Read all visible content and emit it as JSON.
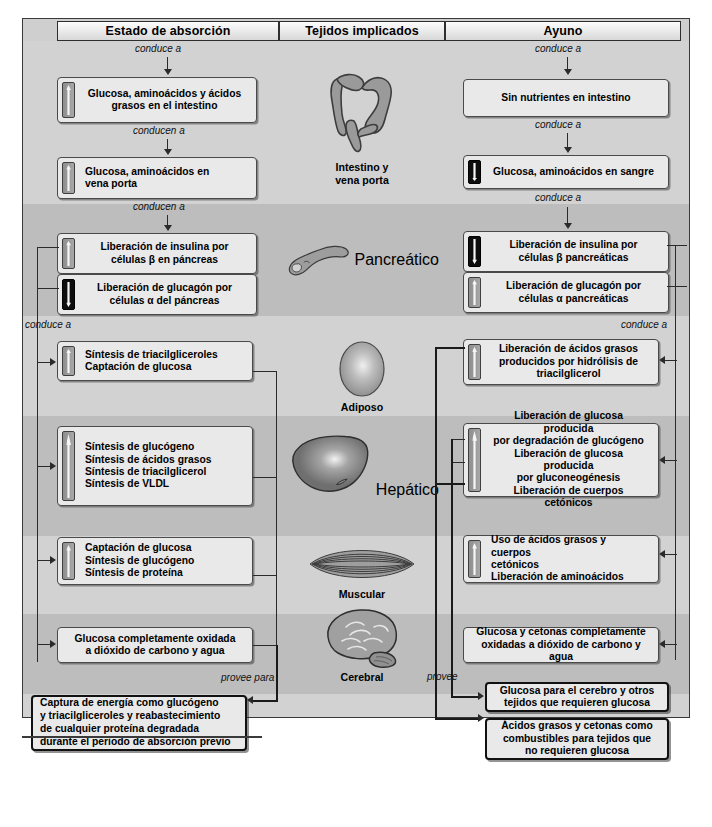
{
  "headers": {
    "left": "Estado de absorción",
    "center": "Tejidos implicados",
    "right": "Ayuno"
  },
  "connector_labels": {
    "l1": "conduce a",
    "l2": "conducen a",
    "l3": "conducen a",
    "l4": "conduce a",
    "r1": "conduce a",
    "r2": "conduce a",
    "r3": "conduce a",
    "r4": "conduce a",
    "provee_para": "provee para",
    "provee": "provee"
  },
  "tissues": [
    {
      "name": "intestine",
      "icon": "intestine-icon",
      "caption": "Intestino y\nvena porta",
      "caption_line1": "Intestino y",
      "caption_line2": "vena porta"
    },
    {
      "name": "pancreas",
      "icon": "pancreas-icon",
      "caption": "Pancreático"
    },
    {
      "name": "adipose",
      "icon": "adipose-icon",
      "caption": "Adiposo"
    },
    {
      "name": "liver",
      "icon": "liver-icon",
      "caption": "Hepático"
    },
    {
      "name": "muscle",
      "icon": "muscle-icon",
      "caption": "Muscular"
    },
    {
      "name": "brain",
      "icon": "brain-icon",
      "caption": "Cerebral"
    }
  ],
  "left_boxes": [
    {
      "id": "intestine",
      "indicator": "up",
      "lines": [
        "Glucosa, aminoácidos y ácidos",
        "grasos en el intestino"
      ]
    },
    {
      "id": "portal",
      "indicator": "up",
      "lines": [
        "Glucosa, aminoácidos en",
        "vena porta"
      ]
    },
    {
      "id": "insulin",
      "indicator": "up",
      "lines": [
        "Liberación de insulina por",
        "células β en páncreas"
      ]
    },
    {
      "id": "glucagon",
      "indicator": "down",
      "lines": [
        "Liberación de glucagón por",
        "células α del páncreas"
      ]
    },
    {
      "id": "adipose",
      "indicator": "up",
      "lines": [
        "Síntesis de triacilgliceroles",
        "Captación de glucosa"
      ]
    },
    {
      "id": "liver",
      "indicator": "up",
      "lines": [
        "Síntesis de glucógeno",
        "Síntesis de ácidos grasos",
        "Síntesis de triacilglicerol",
        "Síntesis de VLDL"
      ]
    },
    {
      "id": "muscle",
      "indicator": "up",
      "lines": [
        "Captación de glucosa",
        "Síntesis de glucógeno",
        "Síntesis de proteína"
      ]
    },
    {
      "id": "brain",
      "indicator": "none",
      "lines": [
        "Glucosa completamente oxidada",
        "a dióxido de carbono y agua"
      ]
    }
  ],
  "right_boxes": [
    {
      "id": "intestine",
      "indicator": "none",
      "lines": [
        "Sin nutrientes en intestino"
      ]
    },
    {
      "id": "blood",
      "indicator": "down",
      "lines": [
        "Glucosa, aminoácidos en sangre"
      ]
    },
    {
      "id": "insulin",
      "indicator": "down",
      "lines": [
        "Liberación de insulina por",
        "células β pancreáticas"
      ]
    },
    {
      "id": "glucagon",
      "indicator": "up",
      "lines": [
        "Liberación de glucagón por",
        "células α pancreáticas"
      ]
    },
    {
      "id": "adipose",
      "indicator": "up",
      "lines": [
        "Liberación de ácidos grasos",
        "producidos por hidrólisis de",
        "triacilglicerol"
      ]
    },
    {
      "id": "liver",
      "indicator": "up",
      "lines": [
        "Liberación de glucosa producida",
        "por degradación de glucógeno",
        "Liberación de glucosa producida",
        "por gluconeogénesis",
        "Liberación de cuerpos cetónicos"
      ]
    },
    {
      "id": "muscle",
      "indicator": "up",
      "lines": [
        "Uso de ácidos grasos y cuerpos",
        "cetónicos",
        "Liberación de aminoácidos"
      ]
    },
    {
      "id": "brain",
      "indicator": "none",
      "lines": [
        "Glucosa y cetonas completamente",
        "oxidadas a dióxido de carbono y agua"
      ]
    }
  ],
  "outcome_boxes": {
    "left": {
      "lines": [
        "Captura de energía como glucógeno",
        "y triacilgliceroles y reabastecimiento",
        "de cualquier proteína degradada",
        "durante el periodo de absorción previo"
      ]
    },
    "right_top": {
      "lines": [
        "Glucosa para el cerebro y otros",
        "tejidos que requieren glucosa"
      ]
    },
    "right_bottom": {
      "lines": [
        "Ácidos grasos y cetonas como",
        "combustibles para tejidos que",
        "no requieren glucosa"
      ]
    }
  },
  "colors": {
    "panel_bg": "#cfcfcf",
    "band_dark": "#bdbdbd",
    "band_light": "#d2d2d2",
    "box_bg": "#e9e9e9",
    "box_border": "#4a4a4a",
    "line": "#2a2a2a",
    "indicator_up": "#a8a8a8",
    "indicator_down": "#0d0d0d"
  }
}
